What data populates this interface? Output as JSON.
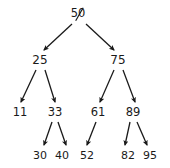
{
  "figure": {
    "background_color": "#ffffff",
    "text_color": "#1a1a1a",
    "edge_color": "#1a1a1a"
  },
  "tree": {
    "root": {
      "id": "n50",
      "label": "50",
      "struck_out": true,
      "x": 78,
      "y": 14
    },
    "level1": [
      {
        "id": "n25",
        "label": "25",
        "x": 40,
        "y": 60
      },
      {
        "id": "n75",
        "label": "75",
        "x": 118,
        "y": 60
      }
    ],
    "level2": [
      {
        "id": "n11",
        "label": "11",
        "x": 20,
        "y": 113
      },
      {
        "id": "n33",
        "label": "33",
        "x": 55,
        "y": 113
      },
      {
        "id": "n61",
        "label": "61",
        "x": 98,
        "y": 113
      },
      {
        "id": "n89",
        "label": "89",
        "x": 133,
        "y": 113
      }
    ],
    "level3": [
      {
        "id": "n30",
        "label": "30",
        "x": 40,
        "y": 155
      },
      {
        "id": "n40",
        "label": "40",
        "x": 62,
        "y": 155
      },
      {
        "id": "n52",
        "label": "52",
        "x": 87,
        "y": 155
      },
      {
        "id": "n82",
        "label": "82",
        "x": 128,
        "y": 155
      },
      {
        "id": "n95",
        "label": "95",
        "x": 150,
        "y": 155
      }
    ],
    "edges": [
      {
        "from": "n50",
        "to": "n25",
        "x1": 72,
        "y1": 24,
        "x2": 44,
        "y2": 50
      },
      {
        "from": "n50",
        "to": "n75",
        "x1": 86,
        "y1": 24,
        "x2": 114,
        "y2": 50
      },
      {
        "from": "n25",
        "to": "n11",
        "x1": 36,
        "y1": 70,
        "x2": 21,
        "y2": 102
      },
      {
        "from": "n25",
        "to": "n33",
        "x1": 45,
        "y1": 70,
        "x2": 55,
        "y2": 102
      },
      {
        "from": "n75",
        "to": "n61",
        "x1": 114,
        "y1": 70,
        "x2": 100,
        "y2": 102
      },
      {
        "from": "n75",
        "to": "n89",
        "x1": 123,
        "y1": 70,
        "x2": 135,
        "y2": 102
      },
      {
        "from": "n33",
        "to": "n30",
        "x1": 52,
        "y1": 122,
        "x2": 44,
        "y2": 145
      },
      {
        "from": "n33",
        "to": "n40",
        "x1": 58,
        "y1": 122,
        "x2": 66,
        "y2": 145
      },
      {
        "from": "n61",
        "to": "n52",
        "x1": 96,
        "y1": 122,
        "x2": 87,
        "y2": 145
      },
      {
        "from": "n89",
        "to": "n82",
        "x1": 130,
        "y1": 122,
        "x2": 125,
        "y2": 145
      },
      {
        "from": "n89",
        "to": "n95",
        "x1": 137,
        "y1": 122,
        "x2": 147,
        "y2": 145
      }
    ]
  }
}
